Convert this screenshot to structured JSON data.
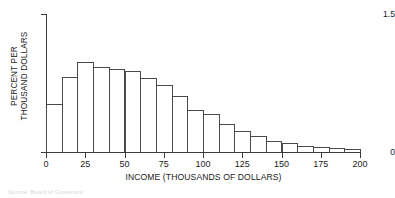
{
  "chart_data": {
    "type": "bar",
    "title": "",
    "subtitle": "",
    "xlabel": "INCOME (THOUSANDS OF DOLLARS)",
    "ylabel_lines": [
      "PERCENT PER",
      "THOUSAND DOLLARS"
    ],
    "ylabel": "PERCENT PER THOUSAND DOLLARS",
    "xlim": [
      0,
      200
    ],
    "ylim": [
      0,
      1.5
    ],
    "xticks": [
      0,
      25,
      50,
      75,
      100,
      125,
      150,
      175,
      200
    ],
    "xtick_labels": [
      "0",
      "25",
      "50",
      "75",
      "100",
      "125",
      "150",
      "175",
      "200"
    ],
    "yticks": [
      0,
      1.5
    ],
    "ytick_labels": [
      "0",
      "1.5"
    ],
    "grid": false,
    "legend": null,
    "bin_width": 10,
    "bin_edges": [
      0,
      10,
      20,
      30,
      40,
      50,
      60,
      70,
      80,
      90,
      100,
      110,
      120,
      130,
      140,
      150,
      160,
      170,
      180,
      190,
      200
    ],
    "categories": [
      "0-10",
      "10-20",
      "20-30",
      "30-40",
      "40-50",
      "50-60",
      "60-70",
      "70-80",
      "80-90",
      "90-100",
      "100-110",
      "110-120",
      "120-130",
      "130-140",
      "140-150",
      "150-160",
      "160-170",
      "170-180",
      "180-190",
      "190-200"
    ],
    "values": [
      0.52,
      0.82,
      0.98,
      0.92,
      0.9,
      0.88,
      0.8,
      0.73,
      0.61,
      0.46,
      0.41,
      0.3,
      0.23,
      0.17,
      0.12,
      0.1,
      0.07,
      0.05,
      0.04,
      0.03
    ],
    "bar_style": {
      "fill": "#ffffff",
      "edge": "#4a4a4a",
      "edge_width": 1
    },
    "axis_color": "#3a3a3a"
  },
  "caption": {
    "text": "Source: Board of Governors"
  }
}
